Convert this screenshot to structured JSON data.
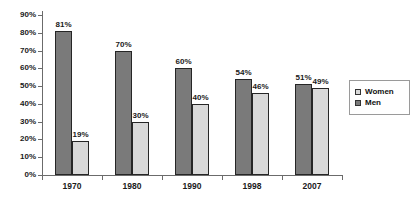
{
  "chart": {
    "background": "#ffffff",
    "axis_color": "#6b6b6b",
    "text_color": "#1a1a1a"
  },
  "chart_data": {
    "type": "bar",
    "title": "",
    "xlabel": "",
    "ylabel": "",
    "categories": [
      "1970",
      "1980",
      "1990",
      "1998",
      "2007"
    ],
    "series": [
      {
        "name": "Men",
        "color": "#7a7a7a",
        "border_color": "#262626",
        "values": [
          81,
          70,
          60,
          54,
          51
        ]
      },
      {
        "name": "Women",
        "color": "#d9d9d9",
        "border_color": "#262626",
        "values": [
          19,
          30,
          40,
          46,
          49
        ]
      }
    ],
    "data_labels": {
      "visible": true,
      "suffix": "%"
    },
    "ylim": [
      0,
      90
    ],
    "ytick_step": 10,
    "yticks": [
      "0%",
      "10%",
      "20%",
      "30%",
      "40%",
      "50%",
      "60%",
      "70%",
      "80%",
      "90%"
    ],
    "grid": false,
    "legend": {
      "position": "right",
      "entries": [
        {
          "label": "Women",
          "color": "#d9d9d9"
        },
        {
          "label": "Men",
          "color": "#7a7a7a"
        }
      ]
    }
  }
}
